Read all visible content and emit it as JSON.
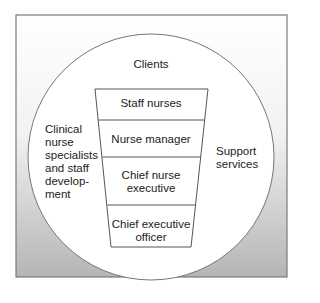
{
  "diagram": {
    "outer_label": "Clients",
    "left_label": [
      "Clinical",
      "nurse",
      "specialists",
      "and staff",
      "develop-",
      "ment"
    ],
    "right_label": [
      "Support",
      "services"
    ],
    "levels": [
      {
        "lines": [
          "Staff nurses"
        ]
      },
      {
        "lines": [
          "Nurse manager"
        ]
      },
      {
        "lines": [
          "Chief nurse",
          "executive"
        ]
      },
      {
        "lines": [
          "Chief executive",
          "officer"
        ]
      }
    ]
  },
  "colors": {
    "frame_top": "#ffffff",
    "frame_bottom": "#b8b8b8",
    "border": "#777777",
    "circle_fill": "#ffffff",
    "text": "#222222"
  }
}
